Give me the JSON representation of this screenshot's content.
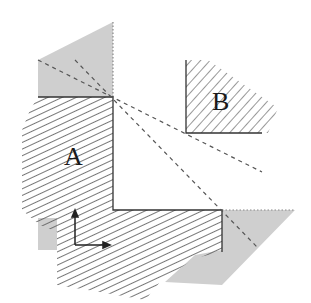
{
  "diagram": {
    "regions": [
      {
        "id": "A",
        "label": "A",
        "fill": "hatched-backslash"
      },
      {
        "id": "B",
        "label": "B",
        "fill": "hatched-slash"
      },
      {
        "id": "shadow-top",
        "fill": "gray"
      },
      {
        "id": "shadow-bottom-right",
        "fill": "gray"
      },
      {
        "id": "shadow-bottom-left",
        "fill": "gray"
      }
    ],
    "labels": {
      "region_a": "A",
      "region_b": "B"
    },
    "axes": {
      "origin": "corner-axes",
      "directions": [
        "up",
        "right"
      ]
    },
    "colors": {
      "gray_fill": "#c8c8c8",
      "hatch": "#555555",
      "line": "#333333",
      "background": "#ffffff"
    }
  }
}
